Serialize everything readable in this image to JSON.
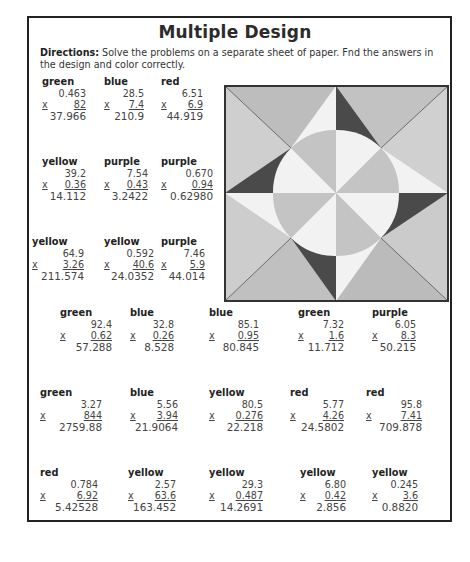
{
  "worksheet": {
    "title": "Multiple Design",
    "directions_label": "Directions:",
    "directions_text": " Solve the problems on a separate sheet of paper. Fnd the answers in the design and color correctly."
  },
  "problems": [
    {
      "color": "green",
      "top": "0.463",
      "times": "x",
      "bottom": "82",
      "answer": "37.966"
    },
    {
      "color": "blue",
      "top": "28.5",
      "times": "x",
      "bottom": "7.4",
      "answer": "210.9"
    },
    {
      "color": "red",
      "top": "6.51",
      "times": "x",
      "bottom": "6.9",
      "answer": "44.919"
    },
    {
      "color": "yellow",
      "top": "39.2",
      "times": "x",
      "bottom": "0.36",
      "answer": "14.112"
    },
    {
      "color": "purple",
      "top": "7.54",
      "times": "x",
      "bottom": "0.43",
      "answer": "3.2422"
    },
    {
      "color": "purple",
      "top": "0.670",
      "times": "x",
      "bottom": "0.94",
      "answer": "0.62980"
    },
    {
      "color": "yellow",
      "top": "64.9",
      "times": "x",
      "bottom": "3.26",
      "answer": "211.574"
    },
    {
      "color": "yellow",
      "top": "0.592",
      "times": "x",
      "bottom": "40.6",
      "answer": "24.0352"
    },
    {
      "color": "purple",
      "top": "7.46",
      "times": "x",
      "bottom": "5.9",
      "answer": "44.014"
    },
    {
      "color": "green",
      "top": "92.4",
      "times": "x",
      "bottom": "0.62",
      "answer": "57.288"
    },
    {
      "color": "blue",
      "top": "32.8",
      "times": "x",
      "bottom": "0.26",
      "answer": "8.528"
    },
    {
      "color": "blue",
      "top": "85.1",
      "times": "x",
      "bottom": "0.95",
      "answer": "80.845"
    },
    {
      "color": "green",
      "top": "7.32",
      "times": "x",
      "bottom": "1.6",
      "answer": "11.712"
    },
    {
      "color": "purple",
      "top": "6.05",
      "times": "x",
      "bottom": "8.3",
      "answer": "50.215"
    },
    {
      "color": "green",
      "top": "3.27",
      "times": "x",
      "bottom": "844",
      "answer": "2759.88"
    },
    {
      "color": "blue",
      "top": "5.56",
      "times": "x",
      "bottom": "3.94",
      "answer": "21.9064"
    },
    {
      "color": "yellow",
      "top": "80.5",
      "times": "x",
      "bottom": "0.276",
      "answer": "22.218"
    },
    {
      "color": "red",
      "top": "5.77",
      "times": "x",
      "bottom": "4.26",
      "answer": "24.5802"
    },
    {
      "color": "red",
      "top": "95.8",
      "times": "x",
      "bottom": "7.41",
      "answer": "709.878"
    },
    {
      "color": "red",
      "top": "0.784",
      "times": "x",
      "bottom": "6.92",
      "answer": "5.42528"
    },
    {
      "color": "yellow",
      "top": "2.57",
      "times": "x",
      "bottom": "63.6",
      "answer": "163.452"
    },
    {
      "color": "yellow",
      "top": "29.3",
      "times": "x",
      "bottom": "0.487",
      "answer": "14.2691"
    },
    {
      "color": "yellow",
      "top": "6.80",
      "times": "x",
      "bottom": "0.42",
      "answer": "2.856"
    },
    {
      "color": "yellow",
      "top": "0.245",
      "times": "x",
      "bottom": "3.6",
      "answer": "0.8820"
    }
  ],
  "design": {
    "shades": {
      "outer_light": "#cfcfcf",
      "outer_mid": "#bdbdbd",
      "white": "#f2f2f2",
      "dark": "#4a4a4a",
      "circle_mid": "#c4c4c4",
      "border": "#333333"
    }
  }
}
